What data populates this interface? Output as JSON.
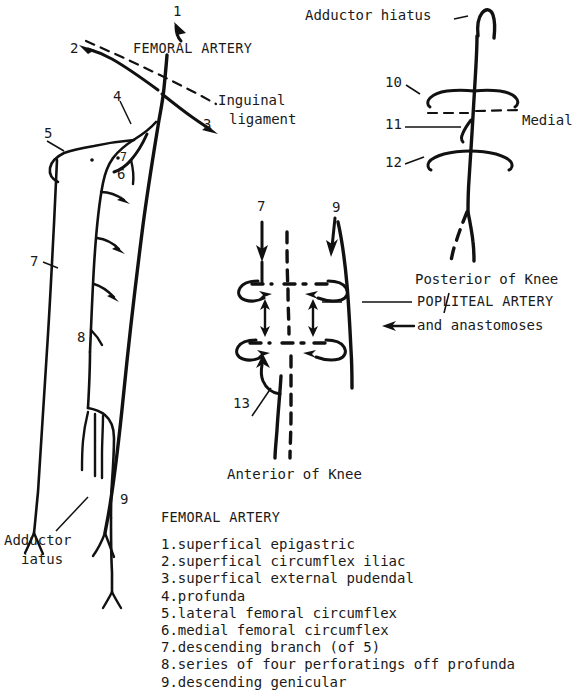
{
  "figure": {
    "title": "FEMORAL ARTERY",
    "background_color": "#ffffff",
    "ink_color": "#111111"
  },
  "panels": {
    "femoral": {
      "name": "Femoral artery of the thigh",
      "heading": "FEMORAL ARTERY",
      "labels": {
        "inguinal_ligament_line1": "Inguinal",
        "inguinal_ligament_line2": "ligament",
        "adductor_hiatus_line1": "Adductor",
        "adductor_hiatus_line2": "iatus"
      },
      "callouts": [
        {
          "id": "1",
          "text": "1"
        },
        {
          "id": "2",
          "text": "2"
        },
        {
          "id": "3",
          "text": "3"
        },
        {
          "id": "4",
          "text": "4"
        },
        {
          "id": "5",
          "text": "5"
        },
        {
          "id": "6",
          "text": "6"
        },
        {
          "id": "7s",
          "text": "7"
        },
        {
          "id": "7",
          "text": "7"
        },
        {
          "id": "8",
          "text": "8"
        },
        {
          "id": "9",
          "text": "9"
        }
      ]
    },
    "popliteal_posterior": {
      "name": "Popliteal artery, posterior view",
      "labels": {
        "adductor_hiatus": "Adductor hiatus",
        "medial": "Medial",
        "posterior_of_knee": "Posterior of Knee"
      },
      "callouts": [
        {
          "id": "10",
          "text": "10"
        },
        {
          "id": "11",
          "text": "11"
        },
        {
          "id": "12",
          "text": "12"
        }
      ]
    },
    "anastomoses": {
      "name": "Popliteal artery and anastomoses, anterior view",
      "labels": {
        "popliteal_artery": "POPLITEAL ARTERY",
        "and_anastomoses": "and anastomoses",
        "anterior_of_knee": "Anterior of Knee"
      },
      "callouts": [
        {
          "id": "7",
          "text": "7"
        },
        {
          "id": "9",
          "text": "9"
        },
        {
          "id": "13",
          "text": "13"
        }
      ]
    }
  },
  "legend": {
    "title": "FEMORAL ARTERY",
    "items": [
      "1.superfical epigastric",
      "2.superfical circumflex iliac",
      "3.superfical external pudendal",
      "4.profunda",
      "5.lateral femoral circumflex",
      "6.medial femoral circumflex",
      "7.descending branch (of 5)",
      "8.series of four perforatings off profunda",
      "9.descending genicular"
    ]
  }
}
